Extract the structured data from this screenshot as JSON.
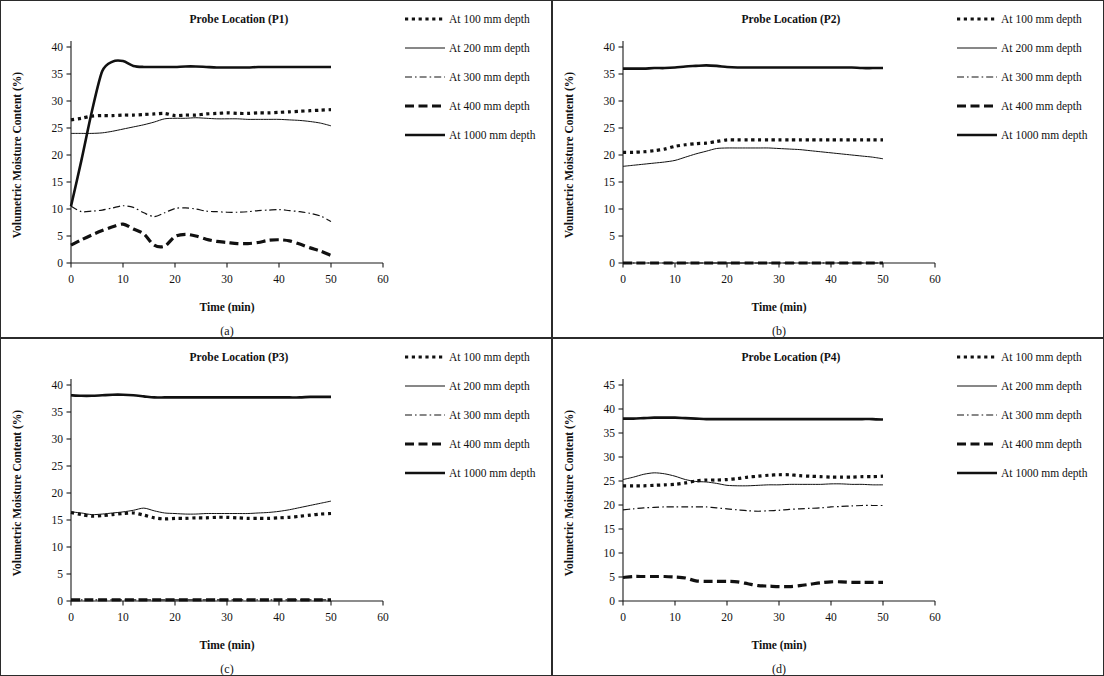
{
  "figure": {
    "axis_labels": {
      "y": "Volumetric Moisture Content (%)",
      "x": "Time (min)"
    },
    "legend_entries": [
      {
        "key": "d100",
        "label": "At 100 mm depth",
        "style": "dotted-square"
      },
      {
        "key": "d200",
        "label": "At 200 mm depth",
        "style": "thin-solid"
      },
      {
        "key": "d300",
        "label": "At 300 mm depth",
        "style": "dash-dot"
      },
      {
        "key": "d400",
        "label": "At 400 mm depth",
        "style": "thick-dash"
      },
      {
        "key": "d1000",
        "label": "At 1000 mm depth",
        "style": "thick-solid"
      }
    ]
  },
  "chart_data": [
    {
      "panel": "a",
      "caption": "(a)",
      "type": "line",
      "title": "Probe Location (P1)",
      "xlabel": "Time (min)",
      "ylabel": "Volumetric Moisture Content (%)",
      "xlim": [
        0,
        60
      ],
      "ylim": [
        0,
        40
      ],
      "xticks": [
        0,
        10,
        20,
        30,
        40,
        50,
        60
      ],
      "yticks": [
        0,
        5,
        10,
        15,
        20,
        25,
        30,
        35,
        40
      ],
      "grid": false,
      "legend_position": "right",
      "x": [
        0,
        2,
        4,
        6,
        8,
        10,
        12,
        14,
        16,
        18,
        20,
        22,
        24,
        26,
        28,
        30,
        32,
        34,
        36,
        38,
        40,
        42,
        44,
        46,
        48,
        50
      ],
      "series": [
        {
          "name": "At 100 mm depth",
          "style": "dotted-square",
          "values": [
            26.5,
            26.8,
            27.2,
            27.3,
            27.3,
            27.4,
            27.4,
            27.5,
            27.6,
            27.7,
            27.3,
            27.4,
            27.4,
            27.6,
            27.7,
            27.8,
            27.7,
            27.7,
            27.8,
            27.8,
            27.9,
            28.0,
            28.1,
            28.2,
            28.3,
            28.4
          ]
        },
        {
          "name": "At 200 mm depth",
          "style": "thin-solid",
          "values": [
            24.0,
            24.0,
            24.0,
            24.1,
            24.4,
            24.8,
            25.2,
            25.6,
            26.1,
            26.7,
            26.8,
            26.8,
            26.9,
            26.8,
            26.7,
            26.7,
            26.7,
            26.6,
            26.6,
            26.6,
            26.6,
            26.5,
            26.4,
            26.2,
            25.9,
            25.4
          ]
        },
        {
          "name": "At 300 mm depth",
          "style": "dash-dot",
          "values": [
            10.5,
            9.5,
            9.6,
            9.8,
            10.2,
            10.6,
            10.3,
            9.3,
            8.6,
            9.3,
            10.1,
            10.2,
            10.0,
            9.6,
            9.5,
            9.4,
            9.4,
            9.5,
            9.7,
            9.8,
            9.9,
            9.7,
            9.5,
            9.2,
            8.7,
            7.7
          ]
        },
        {
          "name": "At 400 mm depth",
          "style": "thick-dash",
          "values": [
            3.3,
            4.3,
            5.2,
            6.0,
            6.7,
            7.2,
            6.3,
            5.4,
            3.3,
            3.1,
            4.9,
            5.3,
            5.0,
            4.4,
            4.0,
            3.8,
            3.6,
            3.6,
            3.8,
            4.2,
            4.3,
            4.1,
            3.5,
            2.8,
            2.2,
            1.4
          ]
        },
        {
          "name": "At 1000 mm depth",
          "style": "thick-solid",
          "values": [
            10.5,
            19.0,
            28.0,
            35.5,
            37.3,
            37.4,
            36.5,
            36.3,
            36.3,
            36.3,
            36.3,
            36.4,
            36.4,
            36.3,
            36.2,
            36.2,
            36.2,
            36.2,
            36.3,
            36.3,
            36.3,
            36.3,
            36.3,
            36.3,
            36.3,
            36.3
          ]
        }
      ]
    },
    {
      "panel": "b",
      "caption": "(b)",
      "type": "line",
      "title": "Probe Location (P2)",
      "xlabel": "Time (min)",
      "ylabel": "Volumetric Moisture Content (%)",
      "xlim": [
        0,
        60
      ],
      "ylim": [
        0,
        40
      ],
      "xticks": [
        0,
        10,
        20,
        30,
        40,
        50,
        60
      ],
      "yticks": [
        0,
        5,
        10,
        15,
        20,
        25,
        30,
        35,
        40
      ],
      "grid": false,
      "legend_position": "right",
      "x": [
        0,
        2,
        4,
        6,
        8,
        10,
        12,
        14,
        16,
        18,
        20,
        22,
        24,
        26,
        28,
        30,
        32,
        34,
        36,
        38,
        40,
        42,
        44,
        46,
        48,
        50
      ],
      "series": [
        {
          "name": "At 100 mm depth",
          "style": "dotted-square",
          "values": [
            20.5,
            20.5,
            20.6,
            20.8,
            21.1,
            21.6,
            21.9,
            22.1,
            22.2,
            22.5,
            22.8,
            22.8,
            22.8,
            22.8,
            22.8,
            22.8,
            22.8,
            22.8,
            22.8,
            22.8,
            22.8,
            22.8,
            22.8,
            22.8,
            22.8,
            22.8
          ]
        },
        {
          "name": "At 200 mm depth",
          "style": "thin-solid",
          "values": [
            17.9,
            18.1,
            18.3,
            18.5,
            18.7,
            19.0,
            19.6,
            20.2,
            20.7,
            21.2,
            21.3,
            21.3,
            21.3,
            21.3,
            21.3,
            21.2,
            21.1,
            21.0,
            20.8,
            20.6,
            20.4,
            20.2,
            20.0,
            19.8,
            19.6,
            19.3
          ]
        },
        {
          "name": "At 300 mm depth",
          "style": "dash-dot",
          "values": [
            0,
            0,
            0,
            0,
            0,
            0,
            0,
            0,
            0,
            0,
            0,
            0,
            0,
            0,
            0,
            0,
            0,
            0,
            0,
            0,
            0,
            0,
            0,
            0,
            0,
            0
          ]
        },
        {
          "name": "At 400 mm depth",
          "style": "thick-dash",
          "values": [
            0,
            0,
            0,
            0,
            0,
            0,
            0,
            0,
            0,
            0,
            0,
            0,
            0,
            0,
            0,
            0,
            0,
            0,
            0,
            0,
            0,
            0,
            0,
            0,
            0,
            0
          ]
        },
        {
          "name": "At 1000 mm depth",
          "style": "thick-solid",
          "values": [
            36.0,
            36.0,
            36.0,
            36.1,
            36.1,
            36.2,
            36.4,
            36.5,
            36.6,
            36.5,
            36.3,
            36.2,
            36.2,
            36.2,
            36.2,
            36.2,
            36.2,
            36.2,
            36.2,
            36.2,
            36.2,
            36.2,
            36.2,
            36.1,
            36.1,
            36.1
          ]
        }
      ]
    },
    {
      "panel": "c",
      "caption": "(c)",
      "type": "line",
      "title": "Probe Location (P3)",
      "xlabel": "Time (min)",
      "ylabel": "Volumetric Moisture Content (%)",
      "xlim": [
        0,
        60
      ],
      "ylim": [
        0,
        40
      ],
      "xticks": [
        0,
        10,
        20,
        30,
        40,
        50,
        60
      ],
      "yticks": [
        0,
        5,
        10,
        15,
        20,
        25,
        30,
        35,
        40
      ],
      "grid": false,
      "legend_position": "right",
      "x": [
        0,
        2,
        4,
        6,
        8,
        10,
        12,
        14,
        16,
        18,
        20,
        22,
        24,
        26,
        28,
        30,
        32,
        34,
        36,
        38,
        40,
        42,
        44,
        46,
        48,
        50
      ],
      "series": [
        {
          "name": "At 100 mm depth",
          "style": "dotted-square",
          "values": [
            16.4,
            16.0,
            15.7,
            15.8,
            16.0,
            16.2,
            16.3,
            15.9,
            15.4,
            15.2,
            15.3,
            15.3,
            15.4,
            15.4,
            15.5,
            15.5,
            15.4,
            15.3,
            15.3,
            15.3,
            15.4,
            15.5,
            15.7,
            15.9,
            16.1,
            16.2
          ]
        },
        {
          "name": "At 200 mm depth",
          "style": "thin-solid",
          "values": [
            16.5,
            16.3,
            16.0,
            16.1,
            16.3,
            16.5,
            16.8,
            17.2,
            16.7,
            16.3,
            16.2,
            16.1,
            16.1,
            16.2,
            16.2,
            16.2,
            16.2,
            16.2,
            16.3,
            16.4,
            16.6,
            16.9,
            17.3,
            17.7,
            18.1,
            18.5
          ]
        },
        {
          "name": "At 300 mm depth",
          "style": "dash-dot",
          "values": [
            0.2,
            0.2,
            0.2,
            0.2,
            0.2,
            0.2,
            0.2,
            0.2,
            0.2,
            0.2,
            0.2,
            0.2,
            0.2,
            0.2,
            0.2,
            0.2,
            0.2,
            0.2,
            0.2,
            0.2,
            0.2,
            0.2,
            0.2,
            0.2,
            0.2,
            0.2
          ]
        },
        {
          "name": "At 400 mm depth",
          "style": "thick-dash",
          "values": [
            0.2,
            0.2,
            0.2,
            0.2,
            0.2,
            0.2,
            0.2,
            0.2,
            0.2,
            0.2,
            0.2,
            0.2,
            0.2,
            0.2,
            0.2,
            0.2,
            0.2,
            0.2,
            0.2,
            0.2,
            0.2,
            0.2,
            0.2,
            0.2,
            0.2,
            0.2
          ]
        },
        {
          "name": "At 1000 mm depth",
          "style": "thick-solid",
          "values": [
            38.1,
            38.0,
            38.0,
            38.1,
            38.2,
            38.2,
            38.1,
            37.9,
            37.7,
            37.7,
            37.7,
            37.7,
            37.7,
            37.7,
            37.7,
            37.7,
            37.7,
            37.7,
            37.7,
            37.7,
            37.7,
            37.7,
            37.7,
            37.8,
            37.8,
            37.8
          ]
        }
      ]
    },
    {
      "panel": "d",
      "caption": "(d)",
      "type": "line",
      "title": "Probe Location (P4)",
      "xlabel": "Time (min)",
      "ylabel": "Volumetric Moisture Content (%)",
      "xlim": [
        0,
        60
      ],
      "ylim": [
        0,
        45
      ],
      "xticks": [
        0,
        10,
        20,
        30,
        40,
        50,
        60
      ],
      "yticks": [
        0,
        5,
        10,
        15,
        20,
        25,
        30,
        35,
        40,
        45
      ],
      "grid": false,
      "legend_position": "right",
      "x": [
        0,
        2,
        4,
        6,
        8,
        10,
        12,
        14,
        16,
        18,
        20,
        22,
        24,
        26,
        28,
        30,
        32,
        34,
        36,
        38,
        40,
        42,
        44,
        46,
        48,
        50
      ],
      "series": [
        {
          "name": "At 100 mm depth",
          "style": "dotted-square",
          "values": [
            24.0,
            24.0,
            24.0,
            24.1,
            24.2,
            24.3,
            24.6,
            25.0,
            25.2,
            25.2,
            25.3,
            25.5,
            25.8,
            26.0,
            26.2,
            26.3,
            26.3,
            26.1,
            26.0,
            25.9,
            25.8,
            25.8,
            25.8,
            25.9,
            25.9,
            26.0
          ]
        },
        {
          "name": "At 200 mm depth",
          "style": "thin-solid",
          "values": [
            25.3,
            25.8,
            26.4,
            26.7,
            26.5,
            26.0,
            25.3,
            24.9,
            24.8,
            24.5,
            24.1,
            24.0,
            24.0,
            24.1,
            24.2,
            24.2,
            24.3,
            24.3,
            24.3,
            24.3,
            24.4,
            24.4,
            24.3,
            24.3,
            24.2,
            24.2
          ]
        },
        {
          "name": "At 300 mm depth",
          "style": "dash-dot",
          "values": [
            19.0,
            19.2,
            19.4,
            19.5,
            19.6,
            19.6,
            19.6,
            19.6,
            19.6,
            19.4,
            19.2,
            19.0,
            18.8,
            18.7,
            18.8,
            18.9,
            19.1,
            19.2,
            19.3,
            19.4,
            19.6,
            19.7,
            19.8,
            19.9,
            19.9,
            19.9
          ]
        },
        {
          "name": "At 400 mm depth",
          "style": "thick-dash",
          "values": [
            4.9,
            5.1,
            5.1,
            5.1,
            5.1,
            5.0,
            4.8,
            4.2,
            4.1,
            4.1,
            4.1,
            4.0,
            3.6,
            3.2,
            3.1,
            3.0,
            3.0,
            3.2,
            3.5,
            3.8,
            4.0,
            4.0,
            3.9,
            3.9,
            3.9,
            3.9
          ]
        },
        {
          "name": "At 1000 mm depth",
          "style": "thick-solid",
          "values": [
            38.0,
            38.0,
            38.1,
            38.2,
            38.2,
            38.2,
            38.1,
            38.0,
            37.9,
            37.9,
            37.9,
            37.9,
            37.9,
            37.9,
            37.9,
            37.9,
            37.9,
            37.9,
            37.9,
            37.9,
            37.9,
            37.9,
            37.9,
            37.9,
            37.9,
            37.8
          ]
        }
      ]
    }
  ]
}
